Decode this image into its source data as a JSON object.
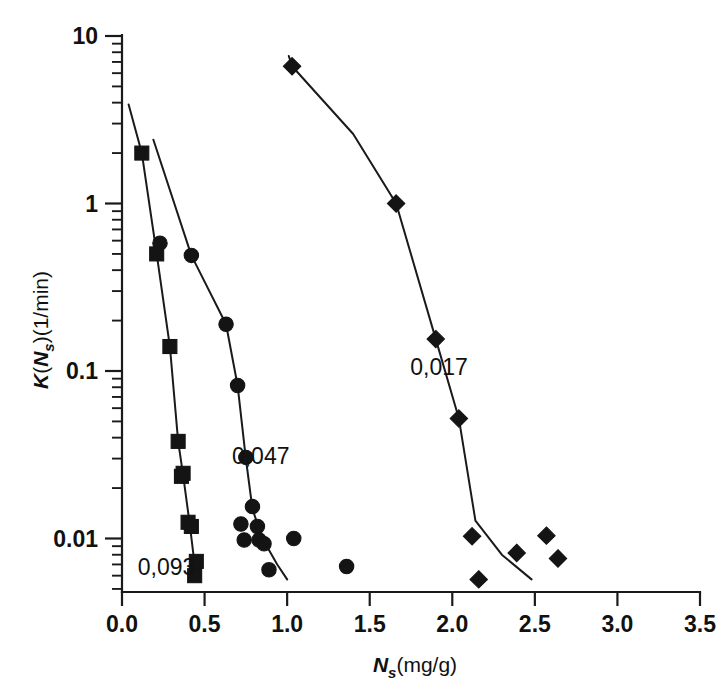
{
  "chart_data": {
    "type": "scatter",
    "title": "",
    "subtitle": "",
    "xlabel": "Ns (mg/g)",
    "xlabel_parts": {
      "symbol": "N",
      "subscript": "s",
      "units": "(mg/g)"
    },
    "ylabel": "K(Ns)(1/min)",
    "ylabel_parts": {
      "symbol": "K",
      "arg": "N",
      "arg_subscript": "s",
      "units": "(1/min)"
    },
    "xscale": "linear",
    "yscale": "log",
    "xlim": [
      0.0,
      3.5
    ],
    "ylim": [
      0.005,
      10
    ],
    "grid": false,
    "legend": "none, series labelled inline",
    "xticks": [
      0.0,
      0.5,
      1.0,
      1.5,
      2.0,
      2.5,
      3.0,
      3.5
    ],
    "xticklabels": [
      "0.0",
      "0.5",
      "1.0",
      "1.5",
      "2.0",
      "2.5",
      "3.0",
      "3.5"
    ],
    "yticks": [
      10,
      1,
      0.1,
      0.01
    ],
    "yticklabels": [
      "10",
      "1",
      "0.1",
      "0.01"
    ],
    "y_minor_decades": [
      1,
      2,
      3,
      4,
      5,
      6,
      7,
      8,
      9
    ],
    "series": [
      {
        "name": "0,093",
        "label": "0,093",
        "marker": "square",
        "annotation": "0,093",
        "annotation_x": 0.27,
        "annotation_y": 0.0068,
        "points": [
          {
            "x": 0.12,
            "y": 2.0
          },
          {
            "x": 0.21,
            "y": 0.5
          },
          {
            "x": 0.29,
            "y": 0.14
          },
          {
            "x": 0.34,
            "y": 0.038
          },
          {
            "x": 0.36,
            "y": 0.0235
          },
          {
            "x": 0.37,
            "y": 0.0245
          },
          {
            "x": 0.4,
            "y": 0.0125
          },
          {
            "x": 0.42,
            "y": 0.0118
          },
          {
            "x": 0.45,
            "y": 0.0073
          },
          {
            "x": 0.44,
            "y": 0.006
          }
        ],
        "curve": [
          {
            "x": 0.04,
            "y": 3.9
          },
          {
            "x": 0.12,
            "y": 2.0
          },
          {
            "x": 0.21,
            "y": 0.5
          },
          {
            "x": 0.29,
            "y": 0.14
          },
          {
            "x": 0.34,
            "y": 0.038
          },
          {
            "x": 0.37,
            "y": 0.024
          },
          {
            "x": 0.41,
            "y": 0.0122
          },
          {
            "x": 0.45,
            "y": 0.0058
          }
        ]
      },
      {
        "name": "0,047",
        "label": "0,047",
        "marker": "circle",
        "annotation": "0,047",
        "annotation_x": 0.84,
        "annotation_y": 0.031,
        "points": [
          {
            "x": 0.23,
            "y": 0.58
          },
          {
            "x": 0.42,
            "y": 0.49
          },
          {
            "x": 0.63,
            "y": 0.19
          },
          {
            "x": 0.7,
            "y": 0.082
          },
          {
            "x": 0.75,
            "y": 0.0305
          },
          {
            "x": 0.79,
            "y": 0.0155
          },
          {
            "x": 0.72,
            "y": 0.0122
          },
          {
            "x": 0.74,
            "y": 0.0098
          },
          {
            "x": 0.82,
            "y": 0.0118
          },
          {
            "x": 0.83,
            "y": 0.0098
          },
          {
            "x": 0.86,
            "y": 0.0093
          },
          {
            "x": 1.04,
            "y": 0.01
          },
          {
            "x": 0.89,
            "y": 0.0065
          },
          {
            "x": 1.36,
            "y": 0.0068
          }
        ],
        "curve": [
          {
            "x": 0.19,
            "y": 2.4
          },
          {
            "x": 0.42,
            "y": 0.49
          },
          {
            "x": 0.63,
            "y": 0.19
          },
          {
            "x": 0.7,
            "y": 0.082
          },
          {
            "x": 0.75,
            "y": 0.03
          },
          {
            "x": 0.79,
            "y": 0.015
          },
          {
            "x": 0.85,
            "y": 0.01
          },
          {
            "x": 0.94,
            "y": 0.007
          },
          {
            "x": 1.0,
            "y": 0.0057
          }
        ]
      },
      {
        "name": "0,017",
        "label": "0,017",
        "marker": "diamond",
        "annotation": "0,017",
        "annotation_x": 1.92,
        "annotation_y": 0.105,
        "points": [
          {
            "x": 1.03,
            "y": 6.6
          },
          {
            "x": 1.66,
            "y": 1.0
          },
          {
            "x": 1.9,
            "y": 0.155
          },
          {
            "x": 2.04,
            "y": 0.052
          },
          {
            "x": 2.12,
            "y": 0.0103
          },
          {
            "x": 2.16,
            "y": 0.0057
          },
          {
            "x": 2.39,
            "y": 0.0082
          },
          {
            "x": 2.57,
            "y": 0.0104
          },
          {
            "x": 2.64,
            "y": 0.0076
          }
        ],
        "curve": [
          {
            "x": 1.01,
            "y": 7.6
          },
          {
            "x": 1.03,
            "y": 6.6
          },
          {
            "x": 1.4,
            "y": 2.6
          },
          {
            "x": 1.66,
            "y": 1.0
          },
          {
            "x": 1.9,
            "y": 0.155
          },
          {
            "x": 2.04,
            "y": 0.052
          },
          {
            "x": 2.14,
            "y": 0.0128
          },
          {
            "x": 2.3,
            "y": 0.008
          },
          {
            "x": 2.48,
            "y": 0.0057
          }
        ]
      }
    ]
  },
  "axes": {
    "x_title_symbol": "N",
    "x_title_sub": "s",
    "x_title_units": "(mg/g)",
    "y_title_k": "K",
    "y_title_open": "(",
    "y_title_n": "N",
    "y_title_sub": "s",
    "y_title_close": ")(1/min)"
  }
}
